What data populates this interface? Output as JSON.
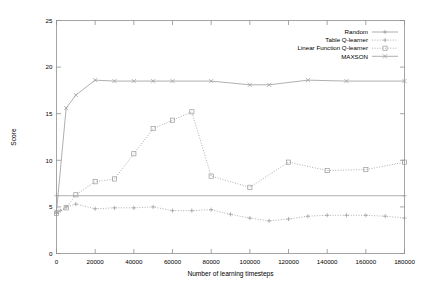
{
  "chart_data": {
    "type": "line",
    "title": "",
    "xlabel": "Number of learning timesteps",
    "ylabel": "Score",
    "xlim": [
      0,
      180000
    ],
    "ylim": [
      0,
      25
    ],
    "xticks": [
      0,
      20000,
      40000,
      60000,
      80000,
      100000,
      120000,
      140000,
      160000,
      180000
    ],
    "xtick_labels": [
      "0",
      "20000",
      "40000",
      "60000",
      "80000",
      "100000",
      "120000",
      "140000",
      "160000",
      "180000"
    ],
    "yticks": [
      0,
      5,
      10,
      15,
      20,
      25
    ],
    "ytick_labels": [
      "0",
      "5",
      "10",
      "15",
      "20",
      "25"
    ],
    "grid": false,
    "legend_position": "top-right",
    "series": [
      {
        "name": "Random",
        "marker": "plus-line",
        "style": "solid",
        "x": [
          0,
          180000
        ],
        "values": [
          6.2,
          6.2
        ]
      },
      {
        "name": "Table Q-learner",
        "marker": "plus",
        "style": "dotted",
        "x": [
          0,
          2000,
          5000,
          10000,
          20000,
          30000,
          40000,
          50000,
          60000,
          70000,
          80000,
          90000,
          100000,
          110000,
          120000,
          130000,
          140000,
          150000,
          160000,
          170000,
          180000
        ],
        "values": [
          4.3,
          4.6,
          5.0,
          5.3,
          4.8,
          4.9,
          4.9,
          5.0,
          4.6,
          4.6,
          4.7,
          4.2,
          3.8,
          3.5,
          3.7,
          4.0,
          4.1,
          4.1,
          4.1,
          4.0,
          3.8
        ]
      },
      {
        "name": "Linear Function Q-learner",
        "marker": "square",
        "style": "dotted",
        "x": [
          0,
          5000,
          10000,
          20000,
          30000,
          40000,
          50000,
          60000,
          70000,
          80000,
          100000,
          120000,
          140000,
          160000,
          180000
        ],
        "values": [
          4.3,
          4.9,
          6.3,
          7.7,
          8.0,
          10.7,
          13.4,
          14.3,
          15.2,
          8.3,
          7.1,
          9.8,
          8.9,
          9.0,
          9.8
        ]
      },
      {
        "name": "MAXSON",
        "marker": "cross",
        "style": "solid",
        "x": [
          0,
          5000,
          10000,
          20000,
          30000,
          40000,
          50000,
          60000,
          80000,
          100000,
          110000,
          130000,
          150000,
          180000
        ],
        "values": [
          4.5,
          15.6,
          17.0,
          18.6,
          18.5,
          18.5,
          18.5,
          18.5,
          18.5,
          18.1,
          18.1,
          18.6,
          18.5,
          18.5
        ]
      }
    ]
  },
  "legend": {
    "items": [
      {
        "label": "Random",
        "marker": "plus"
      },
      {
        "label": "Table Q-learner",
        "marker": "plus"
      },
      {
        "label": "Linear Function Q-learner",
        "marker": "square"
      },
      {
        "label": "MAXSON",
        "marker": "cross"
      }
    ]
  }
}
